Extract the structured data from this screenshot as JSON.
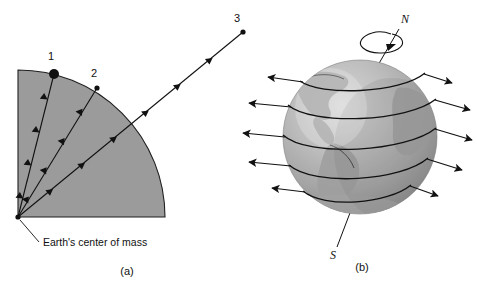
{
  "figure": {
    "panels": [
      {
        "id": "a",
        "caption": "(a)",
        "caption_pos": {
          "x": 127,
          "y": 275
        },
        "description": "Quarter-circle cross-section of the Earth with gravity vectors converging on the center of mass",
        "wedge": {
          "center": {
            "x": 18,
            "y": 217
          },
          "radius": 147,
          "fill_color": "#9b9b9b",
          "stroke_color": "#1a1a1a"
        },
        "center_of_mass": {
          "label": "Earth's center of mass",
          "dot": {
            "x": 18,
            "y": 217,
            "r": 2.6
          },
          "label_pos": {
            "x": 42,
            "y": 246
          },
          "leader": {
            "x1": 21,
            "y1": 220,
            "x2": 39,
            "y2": 242
          }
        },
        "points": [
          {
            "label": "1",
            "x": 54,
            "y": 74,
            "r": 5.0,
            "label_pos": {
              "x": 51,
              "y": 60
            }
          },
          {
            "label": "2",
            "x": 97,
            "y": 88,
            "r": 2.6,
            "label_pos": {
              "x": 94,
              "y": 77
            }
          },
          {
            "label": "3",
            "x": 243,
            "y": 32,
            "r": 2.6,
            "label_pos": {
              "x": 234,
              "y": 22
            }
          }
        ],
        "vectors": [
          {
            "name": "gravity-vector-1",
            "from": {
              "x": 54,
              "y": 74
            },
            "to": {
              "x": 18,
              "y": 217
            },
            "arrowheads": 4
          },
          {
            "name": "gravity-vector-2",
            "from": {
              "x": 97,
              "y": 88
            },
            "to": {
              "x": 18,
              "y": 217
            },
            "arrowheads": 4
          },
          {
            "name": "gravity-vector-3",
            "from": {
              "x": 243,
              "y": 32
            },
            "to": {
              "x": 18,
              "y": 217
            },
            "arrowheads": 6
          }
        ]
      },
      {
        "id": "b",
        "caption": "(b)",
        "caption_pos": {
          "x": 362,
          "y": 271
        },
        "description": "Rotating Earth globe with latitude circles and outward velocity arrows",
        "globe": {
          "center": {
            "x": 360,
            "y": 137
          },
          "radius": 77,
          "fill_light": "#c9c9c9",
          "fill_mid": "#a8a8a8",
          "fill_dark": "#8d8d8d",
          "continent_color": "#9a9a9a",
          "edge_color": "#8a8a8a"
        },
        "poles": [
          {
            "label": "N",
            "name": "north-pole-label",
            "x": 405,
            "y": 22,
            "axis": {
              "x1": 372,
              "y1": 68,
              "x2": 399,
              "y2": 30
            }
          },
          {
            "label": "S",
            "name": "south-pole-label",
            "x": 333,
            "y": 259,
            "axis": {
              "x1": 352,
              "y1": 211,
              "x2": 337,
              "y2": 247
            }
          }
        ],
        "rotation_arrow": {
          "name": "rotation-direction-arrow",
          "cx": 383,
          "cy": 41,
          "rx": 22,
          "ry": 8
        },
        "latitude_bands": [
          {
            "name": "latitude-band-1",
            "y_offset": -58,
            "arrow_length": 30
          },
          {
            "name": "latitude-band-2",
            "y_offset": -32,
            "arrow_length": 44
          },
          {
            "name": "latitude-band-3",
            "y_offset": -2,
            "arrow_length": 52
          },
          {
            "name": "latitude-band-4",
            "y_offset": 28,
            "arrow_length": 44
          },
          {
            "name": "latitude-band-5",
            "y_offset": 56,
            "arrow_length": 30
          }
        ]
      }
    ],
    "colors": {
      "ink": "#111111",
      "wedge_fill": "#9b9b9b",
      "page_background": "#ffffff"
    }
  }
}
